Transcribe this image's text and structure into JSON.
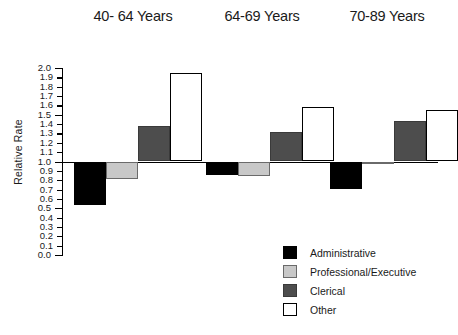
{
  "chart_data": {
    "type": "bar",
    "title": "",
    "xlabel": "",
    "ylabel": "Relative Rate",
    "ylim": [
      0.0,
      2.0
    ],
    "baseline": 1.0,
    "grid": false,
    "legend_position": "bottom-right",
    "categories": [
      "40- 64 Years",
      "64-69 Years",
      "70-89 Years"
    ],
    "tick_labels": [
      "2.0",
      "1.9",
      "1.8",
      "1.7",
      "1.6",
      "1.5",
      "1.4",
      "1.3",
      "1.2",
      "1.1",
      "1.0",
      "0.9",
      "0.8",
      "0.7",
      "0.6",
      "0.5",
      "0.4",
      "0.3",
      "0.2",
      "0.1",
      "0.0"
    ],
    "tick_values": [
      2.0,
      1.9,
      1.8,
      1.7,
      1.6,
      1.5,
      1.4,
      1.3,
      1.2,
      1.1,
      1.0,
      0.9,
      0.8,
      0.7,
      0.6,
      0.5,
      0.4,
      0.3,
      0.2,
      0.1,
      0.0
    ],
    "series": [
      {
        "name": "Administrative",
        "color": "#000000",
        "values": [
          0.53,
          0.86,
          0.71
        ]
      },
      {
        "name": "Professional/Executive",
        "color": "#c8c8c8",
        "values": [
          0.81,
          0.85,
          0.98
        ]
      },
      {
        "name": "Clerical",
        "color": "#4d4d4d",
        "values": [
          1.38,
          1.32,
          1.43
        ]
      },
      {
        "name": "Other",
        "color": "#ffffff",
        "values": [
          1.95,
          1.58,
          1.55
        ]
      }
    ]
  },
  "titles": {
    "group_0": "40- 64 Years",
    "group_1": "64-69 Years",
    "group_2": "70-89 Years"
  },
  "axis": {
    "y_label": "Relative Rate"
  },
  "legend": {
    "items": [
      {
        "label": "Administrative",
        "swatch": "swatch-administrative"
      },
      {
        "label": "Professional/Executive",
        "swatch": "swatch-professional"
      },
      {
        "label": "Clerical",
        "swatch": "swatch-clerical"
      },
      {
        "label": "Other",
        "swatch": "swatch-other"
      }
    ]
  }
}
